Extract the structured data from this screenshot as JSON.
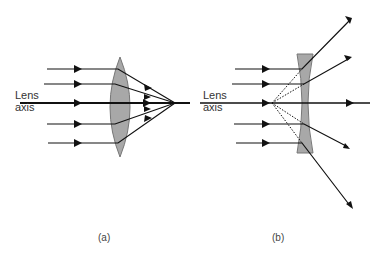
{
  "panels": [
    {
      "id": "a",
      "caption": "(a)",
      "lens_type": "converging (convex)",
      "axis_label": [
        "Lens",
        "axis"
      ]
    },
    {
      "id": "b",
      "caption": "(b)",
      "lens_type": "diverging (concave)",
      "axis_label": [
        "Lens",
        "axis"
      ]
    }
  ],
  "colors": {
    "lens_fill": "#a8a8a8",
    "lens_stroke": "#777777",
    "ray": "#111111"
  }
}
